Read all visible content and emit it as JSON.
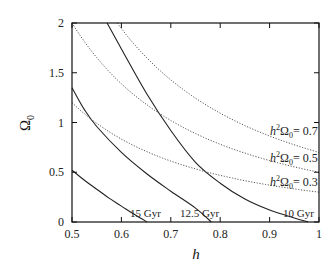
{
  "chart_data": {
    "type": "line",
    "title": "",
    "xlabel": "h",
    "ylabel": "Ω0",
    "xlim": [
      0.5,
      1.0
    ],
    "ylim": [
      0,
      2
    ],
    "xticks": [
      "0.5",
      "0.6",
      "0.7",
      "0.8",
      "0.9",
      "1"
    ],
    "yticks": [
      "0",
      "0.5",
      "1",
      "1.5",
      "2"
    ],
    "grid": false,
    "legend": null,
    "series": [
      {
        "name": "15 Gyr",
        "style": "solid",
        "label": "15 Gyr",
        "points": [
          [
            0.5,
            0.52
          ],
          [
            0.525,
            0.42
          ],
          [
            0.55,
            0.33
          ],
          [
            0.575,
            0.24
          ],
          [
            0.6,
            0.16
          ],
          [
            0.625,
            0.08
          ],
          [
            0.652,
            0.0
          ]
        ]
      },
      {
        "name": "12.5 Gyr",
        "style": "solid",
        "label": "12.5 Gyr",
        "points": [
          [
            0.5,
            1.35
          ],
          [
            0.525,
            1.13
          ],
          [
            0.55,
            0.96
          ],
          [
            0.6,
            0.7
          ],
          [
            0.65,
            0.49
          ],
          [
            0.7,
            0.31
          ],
          [
            0.75,
            0.14
          ],
          [
            0.782,
            0.0
          ]
        ]
      },
      {
        "name": "10 Gyr",
        "style": "solid",
        "label": "10 Gyr",
        "points": [
          [
            0.571,
            2.0
          ],
          [
            0.6,
            1.74
          ],
          [
            0.65,
            1.3
          ],
          [
            0.7,
            0.92
          ],
          [
            0.75,
            0.6
          ],
          [
            0.8,
            0.39
          ],
          [
            0.85,
            0.23
          ],
          [
            0.9,
            0.12
          ],
          [
            0.95,
            0.04
          ],
          [
            0.978,
            0.0
          ]
        ]
      },
      {
        "name": "h^2 Ω0 = 0.7",
        "style": "dotted",
        "label_prefix": "h",
        "label_value": "= 0.7",
        "constant": 0.7,
        "formula": "Ω0 = 0.7 / h^2"
      },
      {
        "name": "h^2 Ω0 = 0.5",
        "style": "dotted",
        "label_value": "= 0.5",
        "constant": 0.5,
        "formula": "Ω0 = 0.5 / h^2"
      },
      {
        "name": "h^2 Ω0 = 0.3",
        "style": "dotted",
        "label_value": "= 0.3",
        "constant": 0.3,
        "formula": "Ω0 = 0.3 / h^2"
      }
    ],
    "annotations": [
      {
        "text": "15 Gyr",
        "x": 0.634,
        "y": 0.07
      },
      {
        "text": "12.5 Gyr",
        "x": 0.762,
        "y": 0.07
      },
      {
        "text": "10 Gyr",
        "x": 0.96,
        "y": 0.07
      },
      {
        "text": "h²Ω₀= 0.7",
        "x": 0.97,
        "y": 0.78
      },
      {
        "text": "h²Ω₀= 0.5",
        "x": 0.97,
        "y": 0.55
      },
      {
        "text": "h²Ω₀= 0.3",
        "x": 0.97,
        "y": 0.31
      }
    ]
  },
  "labels": {
    "xlabel": "h",
    "ylabel_main": "Ω",
    "ylabel_sub": "0",
    "ann_15": "15 Gyr",
    "ann_125": "12.5 Gyr",
    "ann_10": "10 Gyr",
    "h2_h": "h",
    "h2_sup": "2",
    "h2_omega": "Ω",
    "h2_sub": "0",
    "h2_07": "= 0.7",
    "h2_05": "= 0.5",
    "h2_03": "= 0.3"
  }
}
